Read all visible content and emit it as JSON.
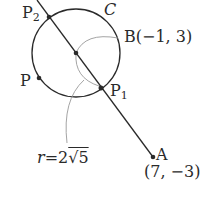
{
  "diagram": {
    "type": "geometry",
    "colors": {
      "ink": "#2a2a2a",
      "leader": "#9a9a9a",
      "background": "#ffffff"
    },
    "circle": {
      "name": "C",
      "center_px": [
        76,
        53
      ],
      "radius_px": 44
    },
    "points": {
      "B": {
        "name": "B",
        "coords": "(−1, 3)",
        "px": [
          76,
          53
        ]
      },
      "A": {
        "name": "A",
        "coords": "(7, −3)",
        "px": [
          153,
          157
        ]
      },
      "P1": {
        "name": "P",
        "sub": "1",
        "px": [
          101,
          88
        ]
      },
      "P2": {
        "name": "P",
        "sub": "2",
        "px": [
          49,
          17
        ]
      },
      "P": {
        "name": "P",
        "px": [
          39,
          77
        ]
      }
    },
    "labels": {
      "circle_label": "C",
      "B_label": "B(−1, 3)",
      "A_label": "A",
      "A_coords": "(7, −3)",
      "P_label": "P",
      "P1_main": "P",
      "P1_sub": "1",
      "P2_main": "P",
      "P2_sub": "2",
      "radius_var": "r",
      "radius_eq": "=2",
      "radius_sqrt": "√5"
    },
    "radius": {
      "symbol": "r",
      "value": "2√5"
    }
  }
}
